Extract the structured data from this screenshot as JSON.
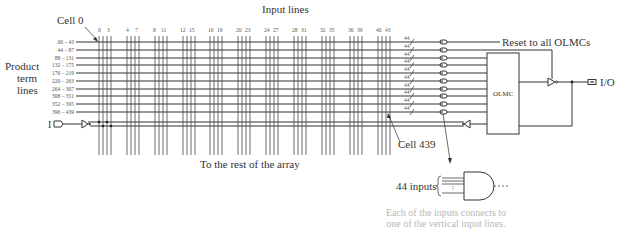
{
  "labels": {
    "input_lines": "Input lines",
    "cell0": "Cell 0",
    "cell439": "Cell 439",
    "product_term_lines": [
      "Product",
      "term",
      "lines"
    ],
    "reset": "Reset to all OLMCs",
    "olmc": "OLMC",
    "io": "I/O",
    "input_pin": "I",
    "rest_of_array": "To the rest of the array",
    "inputs_44": "44 inputs",
    "bus_width": "44",
    "caption": [
      "Each of the inputs connects to",
      "one of the vertical input lines."
    ]
  },
  "row_labels": [
    "00 – 43",
    "44 – 87",
    "88 – 131",
    "132 – 175",
    "176 – 219",
    "220 – 263",
    "264 – 307",
    "308 – 351",
    "352 – 395",
    "396 – 439"
  ],
  "column_groups": [
    {
      "left": "0",
      "right": "3"
    },
    {
      "left": "4",
      "right": "7"
    },
    {
      "left": "8",
      "right": "11"
    },
    {
      "left": "12",
      "right": "15"
    },
    {
      "left": "16",
      "right": "19"
    },
    {
      "left": "20",
      "right": "23"
    },
    {
      "left": "24",
      "right": "27"
    },
    {
      "left": "28",
      "right": "31"
    },
    {
      "left": "32",
      "right": "35"
    },
    {
      "left": "36",
      "right": "39"
    },
    {
      "left": "40",
      "right": "43"
    }
  ],
  "colors": {
    "line": "#333333",
    "caption": "#b8b8b8",
    "background": "#ffffff"
  }
}
